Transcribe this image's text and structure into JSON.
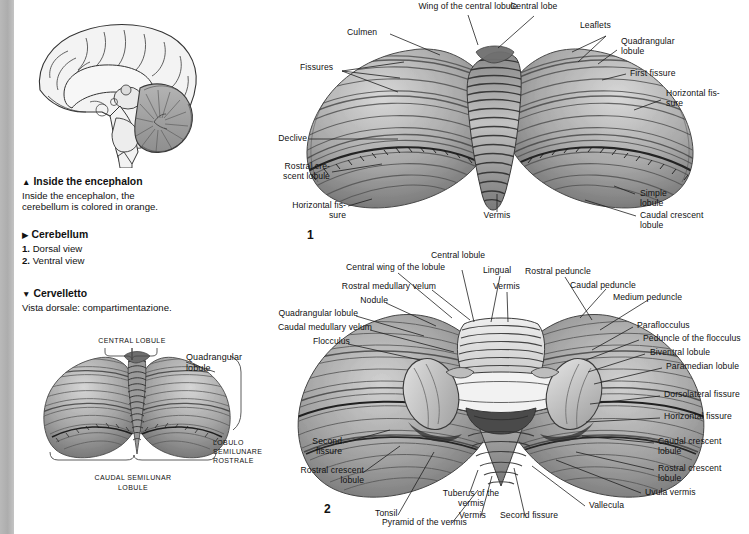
{
  "page": {
    "width": 749,
    "height": 534,
    "background": "#ffffff",
    "edge_band_color": "#b0b0b0",
    "ink_color": "#111111"
  },
  "captions": {
    "inside_encephalon": {
      "marker": "▲",
      "heading": "Inside the encephalon",
      "body": "Inside the encephalon, the cerebellum is colored in orange."
    },
    "cerebellum": {
      "marker": "▶",
      "heading": "Cerebellum",
      "items": [
        {
          "num": "1.",
          "label": "Dorsal view"
        },
        {
          "num": "2.",
          "label": "Ventral view"
        }
      ]
    },
    "cervelletto": {
      "marker": "▼",
      "heading": "Cervelletto",
      "body": "Vista dorsale: compartimentazione."
    }
  },
  "figures": {
    "brain_sagittal": {
      "name": "Inside the encephalon",
      "cerebellum_shading": "#9a9a9a"
    },
    "fig1": {
      "number": "1",
      "title": "Dorsal view",
      "labels": [
        "Wing of the central lobule",
        "Central lobe",
        "Leaflets",
        "Culmen",
        "Quadrangular lobule",
        "Fissures",
        "First fissure",
        "Horizontal fissure",
        "Declive",
        "Rostral crescent lobule",
        "Horizontal fissure",
        "Vermis",
        "Simple lobule",
        "Caudal crescent lobule"
      ]
    },
    "fig2": {
      "number": "2",
      "title": "Ventral view",
      "labels": [
        "Central lobule",
        "Central wing of the lobule",
        "Lingual",
        "Vermis",
        "Rostral peduncle",
        "Caudal peduncle",
        "Medium peduncle",
        "Rostral medullary velum",
        "Nodule",
        "Quadrangular lobule",
        "Caudal medullary velum",
        "Flocculus",
        "Paraflocculus",
        "Peduncle of the flocculus",
        "Biventral lobule",
        "Paramedian lobule",
        "Dorsolateral fissure",
        "Horizontal fissure",
        "Caudal crescent lobule",
        "Rostral crescent lobule",
        "Uvula vermis",
        "Vallecula",
        "Second fissure",
        "Vermis",
        "Tuberus of the vermis",
        "Pyramid of the vermis",
        "Tonsil",
        "Rostral crescent lobule",
        "Second fissure"
      ]
    },
    "fig3": {
      "title": "Vista dorsale: compartimentazione",
      "labels": [
        "Central lobule",
        "Quadrangular lobule",
        "Lobulo semilunare rostrale",
        "Caudal semilunar lobule"
      ]
    }
  },
  "fig1_labels": {
    "wing_central_lobule": "Wing of the central lobule",
    "central_lobe": "Central lobe",
    "leaflets": "Leaflets",
    "culmen": "Culmen",
    "quadrangular_lobule": "Quadrangular\nlobule",
    "fissures": "Fissures",
    "first_fissure": "First fissure",
    "horizontal_fissure_r": "Horizontal fis-\nsure",
    "declive": "Declive",
    "rostral_crescent_lobule": "Rostral cre-\nscent lobule",
    "horizontal_fissure_l": "Horizontal fis-\nsure",
    "vermis": "Vermis",
    "simple_lobule": "Simple\nlobule",
    "caudal_crescent_lobule": "Caudal crescent\nlobule",
    "number": "1"
  },
  "fig2_labels": {
    "central_lobule": "Central lobule",
    "central_wing_lobule": "Central wing of the lobule",
    "lingual": "Lingual",
    "vermis_top": "Vermis",
    "rostral_peduncle": "Rostral peduncle",
    "caudal_peduncle": "Caudal peduncle",
    "medium_peduncle": "Medium peduncle",
    "rostral_medullary_velum": "Rostral medullary velum",
    "nodule": "Nodule",
    "quadrangular_lobule": "Quadrangular lobule",
    "caudal_medullary_velum": "Caudal medullary velum",
    "flocculus": "Flocculus",
    "paraflocculus": "Paraflocculus",
    "peduncle_of_flocculus": "Peduncle of the flocculus",
    "biventral_lobule": "Biventral lobule",
    "paramedian_lobule": "Paramedian lobule",
    "dorsolateral_fissure": "Dorsolateral fissure",
    "horizontal_fissure": "Horizontal fissure",
    "caudal_crescent_lobule": "Caudal crescent\nlobule",
    "rostral_crescent_lobule_r": "Rostral crescent\nlobule",
    "uvula_vermis": "Uvula vermis",
    "vallecula": "Vallecula",
    "second_fissure_r": "Second fissure",
    "vermis_bottom": "Vermis",
    "tuberus_of_vermis": "Tuberus of the\nvermis",
    "pyramid_of_vermis": "Pyramid of the vermis",
    "tonsil": "Tonsil",
    "rostral_crescent_lobule_l": "Rostral crescent\nlobule",
    "second_fissure_l": "Second\nfissure",
    "number": "2"
  },
  "fig3_labels": {
    "central_lobule": "Central lobule",
    "quadrangular_lobule": "Quadrangular\nlobule",
    "lobulo_semilunare_rostrale": "Lobulo semilunare\nrostrale",
    "caudal_semilunar_lobule": "Caudal semilunar\nlobule"
  }
}
